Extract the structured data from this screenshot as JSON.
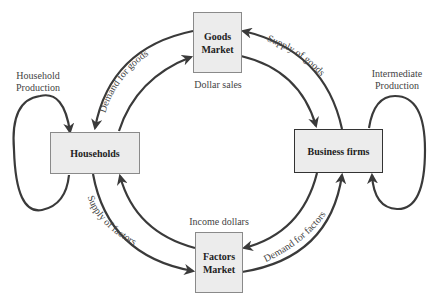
{
  "diagram": {
    "nodes": {
      "goods_market": {
        "line1": "Goods",
        "line2": "Market"
      },
      "households": {
        "label": "Households"
      },
      "business_firms": {
        "label": "Business firms"
      },
      "factors_market": {
        "line1": "Factors",
        "line2": "Market"
      }
    },
    "loops": {
      "household_production": {
        "line1": "Household",
        "line2": "Production"
      },
      "intermediate_production": {
        "line1": "Intermediate",
        "line2": "Production"
      }
    },
    "flows": {
      "demand_for_goods": "Demand for goods",
      "dollar_sales": "Dollar sales",
      "supply_of_goods": "Supply of goods",
      "income_dollars": "Income dollars",
      "supply_of_factors": "Supply of factors",
      "demand_for_factors": "Demand for factors"
    },
    "colors": {
      "arrow": "#3a3a3a",
      "box_fill": "#ececec",
      "box_border": "#8a8a8a"
    }
  }
}
